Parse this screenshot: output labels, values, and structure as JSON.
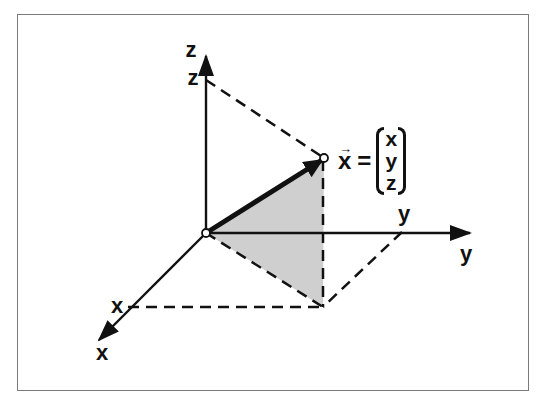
{
  "diagram": {
    "type": "3d-coordinate-vector",
    "axes": {
      "x": {
        "label": "x",
        "tick_label": "x"
      },
      "y": {
        "label": "y",
        "tick_label": "y"
      },
      "z": {
        "label": "z",
        "tick_label": "z"
      }
    },
    "vector": {
      "symbol": "x",
      "arrow_accent": "→",
      "equals": "=",
      "components": [
        "x",
        "y",
        "z"
      ]
    },
    "colors": {
      "axis": "#111111",
      "shade": "#cccccc",
      "frame": "#7a7a7a",
      "dashed": "#111111"
    }
  }
}
